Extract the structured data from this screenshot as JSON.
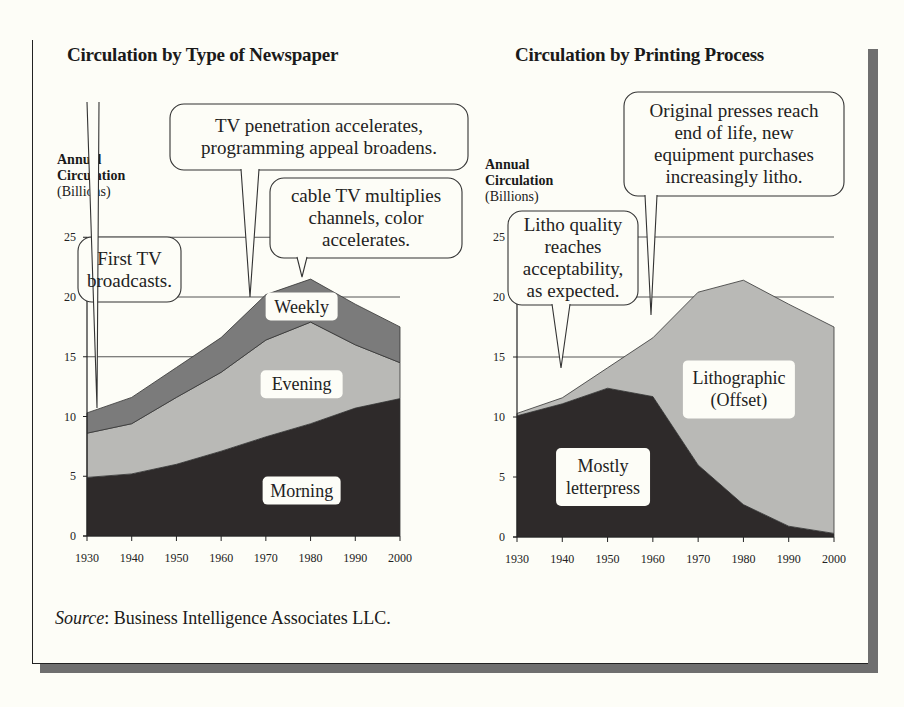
{
  "titles": {
    "left": "Circulation by Type of Newspaper",
    "right": "Circulation by Printing Process"
  },
  "ylabel": {
    "line1": "Annual",
    "line2": "Circulation",
    "line3": "(Billions)"
  },
  "source": {
    "prefix": "Source",
    "text": ": Business Intelligence Associates LLC."
  },
  "colors": {
    "background": "#fdfdf7",
    "morning": "#2e2a2a",
    "evening": "#b9b9b6",
    "weekly": "#7b7b7b",
    "letterpress": "#2e2a2a",
    "lithographic": "#b9b9b6",
    "frame_shadow": "#6f6f6f"
  },
  "chart_data": [
    {
      "type": "area",
      "stacked": true,
      "title": "Circulation by Type of Newspaper",
      "xlabel": "",
      "ylabel": "Annual Circulation (Billions)",
      "x": [
        1930,
        1940,
        1950,
        1960,
        1970,
        1980,
        1990,
        2000
      ],
      "yticks": [
        0,
        5,
        10,
        15,
        20,
        25
      ],
      "ylim": [
        0,
        25
      ],
      "grid": "horizontal at 15, 20, 25",
      "series": [
        {
          "name": "Morning",
          "values": [
            4.9,
            5.2,
            6.0,
            7.1,
            8.3,
            9.4,
            10.7,
            11.5
          ]
        },
        {
          "name": "Evening",
          "values": [
            3.7,
            4.2,
            5.6,
            6.6,
            8.1,
            8.5,
            5.3,
            3.0
          ]
        },
        {
          "name": "Weekly",
          "values": [
            1.7,
            2.2,
            2.5,
            2.9,
            3.8,
            3.6,
            3.4,
            3.0
          ]
        }
      ],
      "series_labels": [
        {
          "text": "Morning",
          "x": 1978,
          "y": 3.8
        },
        {
          "text": "Evening",
          "x": 1978,
          "y": 12.7
        },
        {
          "text": "Weekly",
          "x": 1978,
          "y": 19.2
        }
      ],
      "annotations": [
        {
          "text": [
            "First TV",
            "broadcasts."
          ],
          "x": 1933,
          "y": 11.5
        },
        {
          "text": [
            "TV penetration accelerates,",
            "programming appeal broadens."
          ],
          "x": 1966,
          "y": 20.0
        },
        {
          "text": [
            "cable TV multiplies",
            "channels, color",
            "accelerates."
          ],
          "x": 1977,
          "y": 21.6
        }
      ]
    },
    {
      "type": "area",
      "stacked": true,
      "title": "Circulation by Printing Process",
      "xlabel": "",
      "ylabel": "Annual Circulation (Billions)",
      "x": [
        1930,
        1940,
        1950,
        1960,
        1970,
        1980,
        1990,
        2000
      ],
      "yticks": [
        0,
        5,
        10,
        15,
        20,
        25
      ],
      "ylim": [
        0,
        25
      ],
      "grid": "horizontal at 15, 20, 25",
      "series": [
        {
          "name": "Mostly letterpress",
          "values": [
            10.1,
            11.1,
            12.4,
            11.7,
            6.0,
            2.7,
            0.9,
            0.3
          ]
        },
        {
          "name": "Lithographic (Offset)",
          "values": [
            0.2,
            0.5,
            1.7,
            4.9,
            14.4,
            18.7,
            18.5,
            17.2
          ]
        }
      ],
      "series_labels": [
        {
          "text": [
            "Mostly",
            "letterpress"
          ],
          "x": 1949,
          "y": 5.0
        },
        {
          "text": [
            "Lithographic",
            "(Offset)"
          ],
          "x": 1979,
          "y": 12.3
        }
      ],
      "annotations": [
        {
          "text": [
            "Litho quality",
            "reaches",
            "acceptability,",
            "as expected."
          ],
          "x": 1940,
          "y": 14.2
        },
        {
          "text": [
            "Original presses reach",
            "end of life, new",
            "equipment purchases",
            "increasingly litho."
          ],
          "x": 1959,
          "y": 18.5
        }
      ]
    }
  ]
}
